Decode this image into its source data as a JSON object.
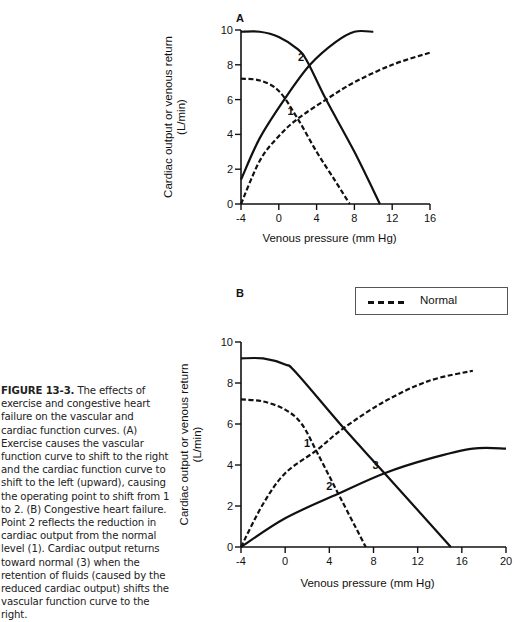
{
  "caption": {
    "figure_label": "FIGURE 13-3.",
    "text": " The effects of exercise and congestive heart failure on the vascular and cardiac function curves. (A) Exercise causes the vascular function curve to shift to the right and the cardiac function curve to shift to the left (upward), causing the operating point to shift from 1 to 2. (B) Congestive heart failure. Point 2 reflects the reduction in cardiac output from the normal level (1). Cardiac output returns toward normal (3) when the retention of fluids (caused by the reduced cardiac output) shifts the vascular function curve to the right."
  },
  "legend": {
    "label": "Normal",
    "style": "dashed"
  },
  "chart_data": [
    {
      "panel": "A",
      "type": "line",
      "title": "Exercise",
      "xlabel": "Venous pressure  (mm Hg)",
      "ylabel": "Cardiac output or venous return",
      "ylabel_units": "(L/min)",
      "xlim": [
        -4,
        16
      ],
      "ylim": [
        0,
        10
      ],
      "xticks": [
        "-4",
        "0",
        "4",
        "8",
        "12",
        "16"
      ],
      "yticks": [
        "0",
        "2",
        "4",
        "6",
        "8",
        "10"
      ],
      "series": [
        {
          "name": "Normal vascular function curve",
          "style": "dashed",
          "points": [
            [
              -4,
              7.2
            ],
            [
              -2,
              7.1
            ],
            [
              0,
              6.5
            ],
            [
              2,
              4.9
            ],
            [
              4,
              3.0
            ],
            [
              6,
              1.3
            ],
            [
              7.5,
              0
            ]
          ]
        },
        {
          "name": "Normal cardiac function curve",
          "style": "dashed",
          "points": [
            [
              -4,
              0
            ],
            [
              -2,
              2.5
            ],
            [
              0,
              3.9
            ],
            [
              2,
              4.9
            ],
            [
              5,
              6.0
            ],
            [
              8,
              7.0
            ],
            [
              12,
              8.0
            ],
            [
              16,
              8.7
            ]
          ]
        },
        {
          "name": "Exercise vascular function curve",
          "style": "solid",
          "points": [
            [
              -4,
              9.9
            ],
            [
              -2,
              9.9
            ],
            [
              0,
              9.6
            ],
            [
              2,
              8.9
            ],
            [
              3,
              8.2
            ],
            [
              5,
              6.0
            ],
            [
              8,
              3.0
            ],
            [
              10.7,
              0
            ]
          ]
        },
        {
          "name": "Exercise cardiac function curve",
          "style": "solid",
          "points": [
            [
              -4,
              1.4
            ],
            [
              -2,
              3.8
            ],
            [
              0.7,
              6.1
            ],
            [
              3.3,
              8.0
            ],
            [
              6,
              9.3
            ],
            [
              8,
              9.9
            ],
            [
              10,
              9.9
            ]
          ]
        }
      ],
      "annotations": [
        {
          "label": "1",
          "x": 2.2,
          "y": 4.9
        },
        {
          "label": "2",
          "x": 3.3,
          "y": 8.0
        }
      ]
    },
    {
      "panel": "B",
      "type": "line",
      "title": "Congestive heart failure",
      "xlabel": "Venous pressure  (mm Hg)",
      "ylabel": "Cardiac output or venous return",
      "ylabel_units": "(L/min)",
      "xlim": [
        -4,
        20
      ],
      "ylim": [
        0,
        10
      ],
      "xticks": [
        "-4",
        "0",
        "4",
        "8",
        "12",
        "16",
        "20"
      ],
      "yticks": [
        "0",
        "2",
        "4",
        "6",
        "8",
        "10"
      ],
      "series": [
        {
          "name": "Normal vascular function curve",
          "style": "dashed",
          "points": [
            [
              -4,
              7.2
            ],
            [
              -2,
              7.1
            ],
            [
              0,
              6.7
            ],
            [
              1.5,
              6.0
            ],
            [
              3,
              4.5
            ],
            [
              5,
              2.4
            ],
            [
              7.3,
              0
            ]
          ]
        },
        {
          "name": "Normal cardiac function curve",
          "style": "dashed",
          "points": [
            [
              -4,
              0
            ],
            [
              -2,
              2.1
            ],
            [
              0,
              3.6
            ],
            [
              2.8,
              4.7
            ],
            [
              5.3,
              5.8
            ],
            [
              9,
              7.1
            ],
            [
              13,
              8.1
            ],
            [
              17,
              8.6
            ]
          ]
        },
        {
          "name": "CHF vascular function curve (fluid retention)",
          "style": "solid",
          "points": [
            [
              -4,
              9.2
            ],
            [
              -2,
              9.2
            ],
            [
              0,
              8.9
            ],
            [
              1,
              8.5
            ],
            [
              5.3,
              5.8
            ],
            [
              9,
              3.6
            ],
            [
              15,
              0
            ]
          ]
        },
        {
          "name": "CHF cardiac function curve",
          "style": "solid",
          "points": [
            [
              -4,
              0
            ],
            [
              0,
              1.4
            ],
            [
              4.8,
              2.6
            ],
            [
              9,
              3.6
            ],
            [
              13,
              4.3
            ],
            [
              17,
              4.8
            ],
            [
              20,
              4.8
            ]
          ]
        }
      ],
      "annotations": [
        {
          "label": "1",
          "x": 2.8,
          "y": 4.7
        },
        {
          "label": "2",
          "x": 4.8,
          "y": 2.6
        },
        {
          "label": "3",
          "x": 9.0,
          "y": 3.6
        }
      ]
    }
  ],
  "panels": {
    "A": {
      "label": "A"
    },
    "B": {
      "label": "B"
    }
  }
}
